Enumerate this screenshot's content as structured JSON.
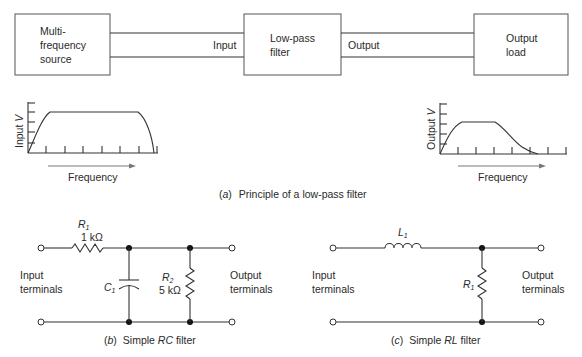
{
  "block_diagram": {
    "source_box": [
      "Multi-",
      "frequency",
      "source"
    ],
    "filter_box": [
      "Low-pass",
      "filter"
    ],
    "load_box": [
      "Output",
      "load"
    ],
    "input_label": "Input",
    "output_label": "Output"
  },
  "input_graph": {
    "ylabel_main": "Input ",
    "ylabel_var": "V",
    "xlabel": "Frequency",
    "response": "flat-passband, falls off at high end"
  },
  "output_graph": {
    "ylabel_main": "Output ",
    "ylabel_var": "V",
    "xlabel": "Frequency",
    "response": "low-pass rolloff"
  },
  "caption_a": {
    "letter": "a",
    "text": "Principle of a low-pass filter"
  },
  "rc_circuit": {
    "r1_name": "R",
    "r1_sub": "1",
    "r1_value": "1 kΩ",
    "c1_name": "C",
    "c1_sub": "1",
    "r2_name": "R",
    "r2_sub": "2",
    "r2_value": "5 kΩ",
    "input_label": [
      "Input",
      "terminals"
    ],
    "output_label": [
      "Output",
      "terminals"
    ]
  },
  "caption_b": {
    "letter": "b",
    "pre": "Simple ",
    "em": "RC",
    "post": " filter"
  },
  "rl_circuit": {
    "l1_name": "L",
    "l1_sub": "1",
    "r1_name": "R",
    "r1_sub": "1",
    "input_label": [
      "Input",
      "terminals"
    ],
    "output_label": [
      "Output",
      "terminals"
    ]
  },
  "caption_c": {
    "letter": "c",
    "pre": "Simple ",
    "em": "RL",
    "post": " filter"
  }
}
